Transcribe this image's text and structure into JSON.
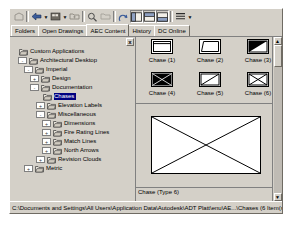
{
  "window": {
    "title": "DesignCenter"
  },
  "toolbar": {
    "buttons": [
      {
        "name": "load-icon",
        "label": "Load",
        "enabled": false
      },
      {
        "name": "back-arrow-icon",
        "label": "Back",
        "enabled": true
      },
      {
        "name": "back-dropdown-arrow",
        "label": "Back history",
        "enabled": true
      },
      {
        "name": "forward-icon",
        "label": "Forward",
        "enabled": true
      },
      {
        "name": "forward-dropdown-arrow",
        "label": "Forward history",
        "enabled": true
      },
      {
        "name": "up-folder-icon",
        "label": "Up",
        "enabled": true
      },
      {
        "name": "search-icon",
        "label": "Search",
        "enabled": true
      },
      {
        "name": "favorites-icon",
        "label": "Favorites",
        "enabled": false
      },
      {
        "name": "home-icon",
        "label": "Home",
        "enabled": true
      },
      {
        "name": "tree-view-toggle-icon",
        "label": "Tree View Toggle",
        "enabled": true
      },
      {
        "name": "preview-icon",
        "label": "Preview",
        "enabled": true
      },
      {
        "name": "description-icon",
        "label": "Description",
        "enabled": true
      },
      {
        "name": "views-icon",
        "label": "Views",
        "enabled": true
      },
      {
        "name": "views-dropdown-arrow",
        "label": "Views menu",
        "enabled": true
      }
    ]
  },
  "tabs": [
    {
      "label": "Folders",
      "active": false
    },
    {
      "label": "Open Drawings",
      "active": false
    },
    {
      "label": "AEC Content",
      "active": true
    },
    {
      "label": "History",
      "active": false
    },
    {
      "label": "DC Online",
      "active": false
    }
  ],
  "tree": {
    "close_label": "x",
    "items": [
      {
        "label": "Custom Applications",
        "depth": 0,
        "expander": "",
        "selected": false
      },
      {
        "label": "Architectural Desktop",
        "depth": 1,
        "expander": "-",
        "selected": false
      },
      {
        "label": "Imperial",
        "depth": 2,
        "expander": "-",
        "selected": false
      },
      {
        "label": "Design",
        "depth": 3,
        "expander": "+",
        "selected": false
      },
      {
        "label": "Documentation",
        "depth": 3,
        "expander": "-",
        "selected": false
      },
      {
        "label": "Chases",
        "depth": 4,
        "expander": "",
        "selected": true
      },
      {
        "label": "Elevation Labels",
        "depth": 4,
        "expander": "+",
        "selected": false
      },
      {
        "label": "Miscellaneous",
        "depth": 4,
        "expander": "-",
        "selected": false
      },
      {
        "label": "Dimensions",
        "depth": 5,
        "expander": "+",
        "selected": false
      },
      {
        "label": "Fire Rating Lines",
        "depth": 5,
        "expander": "+",
        "selected": false
      },
      {
        "label": "Match Lines",
        "depth": 5,
        "expander": "+",
        "selected": false
      },
      {
        "label": "North Arrows",
        "depth": 5,
        "expander": "+",
        "selected": false
      },
      {
        "label": "Revision Clouds",
        "depth": 4,
        "expander": "+",
        "selected": false
      },
      {
        "label": "Metric",
        "depth": 2,
        "expander": "+",
        "selected": false
      }
    ]
  },
  "content": {
    "items": [
      {
        "label": "Chase (1)",
        "glyph": "rect-notch"
      },
      {
        "label": "Chase (2)",
        "glyph": "trapezoid"
      },
      {
        "label": "Chase (3)",
        "glyph": "half-filled-diagonal"
      },
      {
        "label": "Chase (4)",
        "glyph": "filled-dark"
      },
      {
        "label": "Chase (5)",
        "glyph": "diagonal-line"
      },
      {
        "label": "Chase (6)",
        "glyph": "bowtie-x"
      }
    ],
    "preview_alt": "Chase block preview",
    "description": "Chase (Type 6)"
  },
  "statusbar": {
    "path": "C:\\Documents and Settings\\All Users\\Application Data\\Autodesk\\ADT Platt\\enu\\AE...\\Chases (6 Item(s))"
  },
  "scrollbar": {
    "up_label": "▲",
    "down_label": "▼",
    "close_label": "x"
  }
}
